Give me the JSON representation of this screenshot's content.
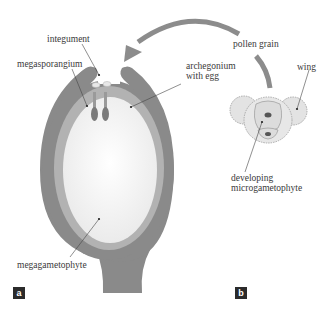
{
  "labels": {
    "integument": "integument",
    "megasporangium": "megasporangium",
    "archegonium_line1": "archegonium",
    "archegonium_line2": "with egg",
    "pollen_grain": "pollen grain",
    "wing": "wing",
    "developing_line1": "developing",
    "developing_line2": "microgametophyte",
    "megagametophyte": "megagametophyte"
  },
  "panels": {
    "a": "a",
    "b": "b"
  },
  "colors": {
    "integument": "#8a8a8a",
    "megasporangium": "#b2b2b2",
    "megagametophyte": "#f4f4f4",
    "pollen_fill": "#e3e3e3",
    "arrow": "#8c8c8c",
    "tag_bg": "#2b2b2b"
  }
}
